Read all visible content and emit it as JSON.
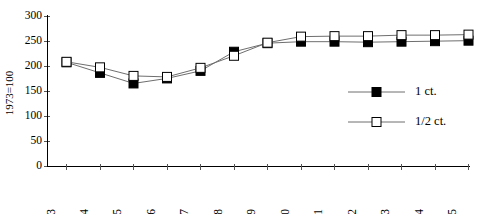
{
  "chart_data": {
    "type": "line",
    "title": "",
    "subtitle": "",
    "xlabel": "",
    "ylabel": "1973=100",
    "x": [
      1983,
      1984,
      1985,
      1986,
      1987,
      1988,
      1989,
      1990,
      1991,
      1992,
      1993,
      1994,
      1995
    ],
    "categories": [
      "1983",
      "1984",
      "1985",
      "1986",
      "1987",
      "1988",
      "1989",
      "1990",
      "1991",
      "1992",
      "1993",
      "1994",
      "1995"
    ],
    "series": [
      {
        "name": "1 ct.",
        "marker": "filled-square",
        "color": "#000000",
        "line_color": "#6e6e6e",
        "values": [
          207,
          186,
          165,
          175,
          190,
          228,
          245,
          248,
          248,
          247,
          248,
          249,
          250
        ]
      },
      {
        "name": "1/2 ct.",
        "marker": "open-square",
        "color": "#ffffff",
        "line_color": "#6e6e6e",
        "values": [
          208,
          197,
          180,
          178,
          196,
          220,
          246,
          258,
          259,
          259,
          261,
          261,
          262
        ]
      }
    ],
    "ylim": [
      0,
      300
    ],
    "yticks": [
      0,
      50,
      100,
      150,
      200,
      250,
      300
    ],
    "ytick_labels": [
      "0",
      "50",
      "100",
      "150",
      "200",
      "250",
      "300"
    ],
    "xtick_labels": [
      "1983",
      "1984",
      "1985",
      "1986",
      "1987",
      "1988",
      "1989",
      "1990",
      "1991",
      "1992",
      "1993",
      "1994",
      "1995"
    ],
    "grid": false,
    "legend_position": "center-right",
    "legend": [
      "1 ct.",
      "1/2 ct."
    ]
  },
  "legend": {
    "entries": [
      {
        "label": "1 ct.",
        "marker": "filled-square"
      },
      {
        "label": "1/2 ct.",
        "marker": "open-square"
      }
    ]
  },
  "axes": {
    "y_title": "1973=100",
    "y_labels": [
      "300",
      "250",
      "200",
      "150",
      "100",
      "50",
      "0"
    ],
    "x_labels": [
      "1983",
      "1984",
      "1985",
      "1986",
      "1987",
      "1988",
      "1989",
      "1990",
      "1991",
      "1992",
      "1993",
      "1994",
      "1995"
    ]
  }
}
